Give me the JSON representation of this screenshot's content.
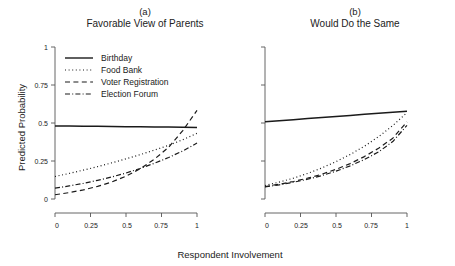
{
  "figure": {
    "axis_x_title": "Respondent Involvement",
    "axis_y_title": "Predicted Probability"
  },
  "legend": {
    "items": [
      {
        "label": "Birthday",
        "style": "solid",
        "key_name": "legend-key-birthday"
      },
      {
        "label": "Food Bank",
        "style": "dotted",
        "key_name": "legend-key-food-bank"
      },
      {
        "label": "Voter Registration",
        "style": "dashed",
        "key_name": "legend-key-voter-registration"
      },
      {
        "label": "Election Forum",
        "style": "dashdot",
        "key_name": "legend-key-election-forum"
      }
    ]
  },
  "panels": [
    {
      "letter": "(a)",
      "name": "Favorable View of Parents"
    },
    {
      "letter": "(b)",
      "name": "Would Do the Same"
    }
  ],
  "ticks": {
    "x": [
      "0",
      "0.25",
      "0.5",
      "0.75",
      "1"
    ],
    "y": [
      "0",
      "0.25",
      "0.5",
      "0.75",
      "1"
    ]
  },
  "chart_data": [
    {
      "type": "line",
      "title": "Favorable View of Parents",
      "panel": "(a)",
      "xlabel": "Respondent Involvement",
      "ylabel": "Predicted Probability",
      "xlim": [
        0,
        1
      ],
      "ylim": [
        0,
        1
      ],
      "xticks": [
        0,
        0.25,
        0.5,
        0.75,
        1
      ],
      "yticks": [
        0,
        0.25,
        0.5,
        0.75,
        1
      ],
      "grid": false,
      "legend_position": "top-left-inside",
      "x": [
        0,
        0.1,
        0.2,
        0.3,
        0.4,
        0.5,
        0.6,
        0.7,
        0.8,
        0.9,
        1
      ],
      "series": [
        {
          "name": "Birthday",
          "style": "solid",
          "values": [
            0.481,
            0.48,
            0.479,
            0.478,
            0.477,
            0.476,
            0.475,
            0.474,
            0.473,
            0.472,
            0.471
          ]
        },
        {
          "name": "Food Bank",
          "style": "dotted",
          "values": [
            0.148,
            0.168,
            0.19,
            0.213,
            0.238,
            0.264,
            0.292,
            0.322,
            0.353,
            0.39,
            0.432
          ]
        },
        {
          "name": "Voter Registration",
          "style": "dashed",
          "values": [
            0.028,
            0.042,
            0.06,
            0.083,
            0.112,
            0.15,
            0.199,
            0.262,
            0.34,
            0.45,
            0.583
          ]
        },
        {
          "name": "Election Forum",
          "style": "dashdot",
          "values": [
            0.071,
            0.086,
            0.103,
            0.123,
            0.145,
            0.171,
            0.201,
            0.235,
            0.273,
            0.316,
            0.368
          ]
        }
      ]
    },
    {
      "type": "line",
      "title": "Would Do the Same",
      "panel": "(b)",
      "xlabel": "Respondent Involvement",
      "ylabel": "Predicted Probability",
      "xlim": [
        0,
        1
      ],
      "ylim": [
        0,
        1
      ],
      "xticks": [
        0,
        0.25,
        0.5,
        0.75,
        1
      ],
      "yticks": [
        0,
        0.25,
        0.5,
        0.75,
        1
      ],
      "grid": false,
      "legend_position": "none",
      "x": [
        0,
        0.1,
        0.2,
        0.3,
        0.4,
        0.5,
        0.6,
        0.7,
        0.8,
        0.9,
        1
      ],
      "series": [
        {
          "name": "Birthday",
          "style": "solid",
          "values": [
            0.508,
            0.515,
            0.522,
            0.529,
            0.536,
            0.543,
            0.55,
            0.557,
            0.564,
            0.571,
            0.578
          ]
        },
        {
          "name": "Food Bank",
          "style": "dotted",
          "values": [
            0.089,
            0.111,
            0.137,
            0.168,
            0.204,
            0.246,
            0.293,
            0.347,
            0.41,
            0.483,
            0.568
          ]
        },
        {
          "name": "Voter Registration",
          "style": "dashed",
          "values": [
            0.082,
            0.097,
            0.115,
            0.137,
            0.163,
            0.195,
            0.233,
            0.279,
            0.334,
            0.4,
            0.508
          ]
        },
        {
          "name": "Election Forum",
          "style": "dashdot",
          "values": [
            0.079,
            0.093,
            0.11,
            0.13,
            0.154,
            0.183,
            0.218,
            0.26,
            0.31,
            0.378,
            0.485
          ]
        }
      ]
    }
  ]
}
